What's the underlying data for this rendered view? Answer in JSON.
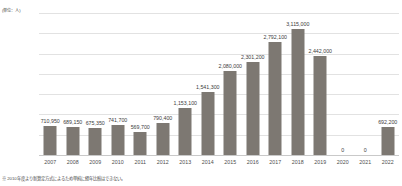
{
  "chart_data": {
    "type": "bar",
    "title": "",
    "unit_label": "(単位：人)",
    "xlabel": "",
    "ylabel": "",
    "ylim": [
      0,
      3500000
    ],
    "ytick_values": [
      3500000,
      3000000,
      2500000,
      2000000,
      1500000,
      1000000,
      500000,
      0
    ],
    "ytick_labels": [
      "3,500,000",
      "3,000,000",
      "2,500,000",
      "2,000,000",
      "1,500,000",
      "1,000,000",
      "500,000",
      "0"
    ],
    "grid": true,
    "legend": "none",
    "bar_color": "#7d7872",
    "categories": [
      "2007",
      "2008",
      "2009",
      "2010",
      "2011",
      "2012",
      "2013",
      "2014",
      "2015",
      "2016",
      "2017",
      "2018",
      "2019",
      "2020",
      "2021",
      "2022"
    ],
    "values": [
      710950,
      689150,
      675350,
      741700,
      569700,
      790400,
      1153100,
      1541300,
      2080000,
      2301200,
      2792100,
      3115000,
      2442000,
      0,
      0,
      692200
    ],
    "value_labels": [
      "710,950",
      "689,150",
      "675,350",
      "741,700",
      "569,700",
      "790,400",
      "1,153,100",
      "1,541,300",
      "2,080,000",
      "2,301,200",
      "2,792,100",
      "3,115,000",
      "2,442,000",
      "0",
      "0",
      "692,200"
    ],
    "footnote": "※ 2010年度より新算定方式によるため単純に経年比較はできない。"
  }
}
